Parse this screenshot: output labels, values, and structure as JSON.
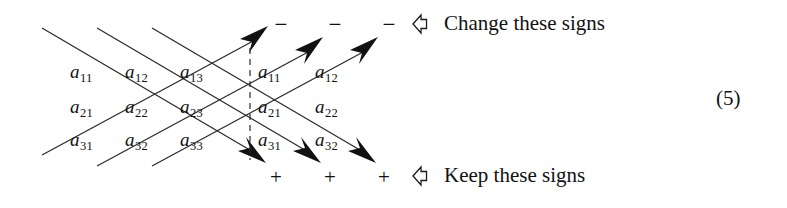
{
  "figure": {
    "kind": "sarrus-rule-determinant-diagram",
    "equation_number": "(5)"
  },
  "matrix": {
    "rows": [
      [
        {
          "base": "a",
          "sub": "11"
        },
        {
          "base": "a",
          "sub": "12"
        },
        {
          "base": "a",
          "sub": "13"
        },
        {
          "base": "a",
          "sub": "11"
        },
        {
          "base": "a",
          "sub": "12"
        }
      ],
      [
        {
          "base": "a",
          "sub": "21"
        },
        {
          "base": "a",
          "sub": "22"
        },
        {
          "base": "a",
          "sub": "23"
        },
        {
          "base": "a",
          "sub": "21"
        },
        {
          "base": "a",
          "sub": "22"
        }
      ],
      [
        {
          "base": "a",
          "sub": "31"
        },
        {
          "base": "a",
          "sub": "32"
        },
        {
          "base": "a",
          "sub": "33"
        },
        {
          "base": "a",
          "sub": "31"
        },
        {
          "base": "a",
          "sub": "32"
        }
      ]
    ]
  },
  "signs": {
    "top": [
      "−",
      "−",
      "−"
    ],
    "bottom": [
      "+",
      "+",
      "+"
    ]
  },
  "annotations": {
    "top": {
      "pointer": "hollow-left-arrow-icon",
      "label": "Change these signs"
    },
    "bottom": {
      "pointer": "hollow-left-arrow-icon",
      "label": "Keep these signs"
    }
  },
  "colors": {
    "ink": "#111111",
    "background": "#ffffff",
    "line": "#2a2a2a"
  }
}
